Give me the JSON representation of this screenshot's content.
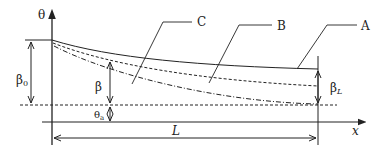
{
  "diagram": {
    "axes": {
      "y_label": "θ",
      "x_label": "x"
    },
    "curves": [
      {
        "name": "A",
        "style": "solid"
      },
      {
        "name": "B",
        "style": "dashed"
      },
      {
        "name": "C",
        "style": "dash-dot"
      }
    ],
    "labels": {
      "beta0": "β",
      "beta0_sub": "0",
      "beta": "β",
      "theta_a": "θ",
      "theta_a_sub": "a",
      "beta_L": "β",
      "beta_L_sub": "L",
      "length": "L",
      "curve_a": "A",
      "curve_b": "B",
      "curve_c": "C"
    },
    "colors": {
      "line": "#222222",
      "background": "#ffffff"
    }
  }
}
